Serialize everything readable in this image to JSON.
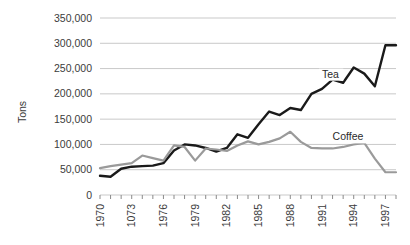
{
  "chart_data": {
    "type": "line",
    "title": "",
    "xlabel": "",
    "ylabel": "Tons",
    "ylim": [
      0,
      350000
    ],
    "ytick_values": [
      0,
      50000,
      100000,
      150000,
      200000,
      250000,
      300000,
      350000
    ],
    "ytick_labels": [
      "0",
      "50,000",
      "100,000",
      "150,000",
      "200,000",
      "250,000",
      "300,000",
      "350,000"
    ],
    "grid": true,
    "legend_position": "inline-labels",
    "x": [
      1970,
      1971,
      1972,
      1973,
      1974,
      1975,
      1976,
      1977,
      1978,
      1979,
      1980,
      1981,
      1982,
      1983,
      1984,
      1985,
      1986,
      1987,
      1988,
      1989,
      1990,
      1991,
      1992,
      1993,
      1994,
      1995,
      1996,
      1997,
      1998
    ],
    "xtick_values": [
      1970,
      1971,
      1972,
      1973,
      1974,
      1975,
      1976,
      1977,
      1978,
      1979,
      1980,
      1981,
      1982,
      1983,
      1984,
      1985,
      1986,
      1987,
      1988,
      1989,
      1990,
      1991,
      1992,
      1993,
      1994,
      1995,
      1996,
      1997,
      1998
    ],
    "xtick_labeled": [
      1970,
      1973,
      1976,
      1979,
      1982,
      1985,
      1988,
      1991,
      1994,
      1997
    ],
    "xtick_labels": [
      "1970",
      "1073",
      "1976",
      "1979",
      "1982",
      "1985",
      "1988",
      "1991",
      "1994",
      "1997"
    ],
    "series": [
      {
        "name": "Tea",
        "color": "#1a1a1a",
        "label_x": 1991,
        "label_y": 232000,
        "values": [
          38000,
          36000,
          52000,
          56000,
          57000,
          58000,
          63000,
          88000,
          100000,
          98000,
          93000,
          86000,
          93000,
          120000,
          113000,
          140000,
          165000,
          158000,
          172000,
          168000,
          200000,
          210000,
          228000,
          222000,
          252000,
          240000,
          215000,
          296000,
          296000
        ]
      },
      {
        "name": "Coffee",
        "color": "#9a9a9a",
        "label_x": 1992,
        "label_y": 108000,
        "values": [
          53000,
          57000,
          60000,
          63000,
          78000,
          73000,
          68000,
          98000,
          95000,
          68000,
          92000,
          90000,
          87000,
          98000,
          106000,
          100000,
          105000,
          112000,
          125000,
          105000,
          93000,
          92000,
          92000,
          95000,
          100000,
          103000,
          72000,
          45000,
          45000
        ]
      }
    ]
  },
  "axis": {
    "ylabel_text": "Tons"
  }
}
